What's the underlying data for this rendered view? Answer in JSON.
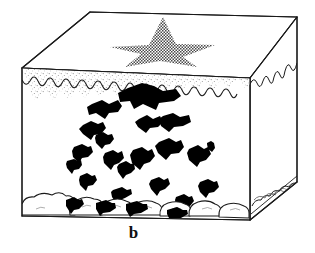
{
  "figure": {
    "caption_label": "b",
    "title_alt": "Block diagram of sediment profile",
    "colors": {
      "line": "#1a1a1a",
      "clast_fill": "#000000",
      "halftone": "#555555",
      "stipple": "#7a7a7a",
      "background": "#ffffff"
    }
  },
  "geometry": {
    "front_face": {
      "top_left": [
        22,
        68
      ],
      "top_right": [
        250,
        78
      ],
      "bottom_right": [
        250,
        220
      ],
      "bottom_left": [
        22,
        216
      ]
    },
    "top_face": {
      "front_left": [
        22,
        68
      ],
      "back_left": [
        90,
        12
      ],
      "back_right": [
        297,
        17
      ],
      "front_right": [
        250,
        78
      ]
    },
    "right_face": {
      "front_top": [
        250,
        78
      ],
      "back_top": [
        297,
        17
      ],
      "back_bottom": [
        297,
        182
      ],
      "front_bottom": [
        250,
        220
      ]
    }
  },
  "elements": {
    "top_surface_star": {
      "name": "halftone-star",
      "points": "163,18 175,45 214,46 182,58 196,66 160,62 126,66 141,54 110,48 148,45",
      "fill_pattern": "checkerboard-halftone"
    },
    "surface_layer": {
      "name": "stippled-surface-layer",
      "description": "thin stippled band below top edge of front face",
      "wavy_baseline": "M22,82 q4,9 9,2 q4,-8 8,1 q4,9 8,1 q4,-9 8,0 q4,10 8,2 q5,-10 9,0 q4,9 8,1 q4,-9 8,0 q4,10 8,1 q4,-9 8,-1 q4,10 8,1 q4,-9 8,-1 q4,10 8,0 q4,-9 8,-1 q4,10 8,0 q4,-9 8,-1 q4,10 8,0 q4,-9 8,-1 q4,10 8,0 q4,-9 8,-1 q4,10 8,0 q4,-9 8,-1 q5,10 9,0 q4,-9 8,-1 q4,10 8,-1 q4,-9 8,-1"
    },
    "right_face_wavy_edge": {
      "name": "right-face-surface-wave",
      "description": "scalloped surface boundary descending along the right face"
    },
    "basal_layer": {
      "name": "cobble-gravel-layer",
      "description": "rounded cobble / boulder clasts forming the base of the front face",
      "cobble_count": 9
    },
    "right_face_cobbles": {
      "name": "right-face-cobble-layer",
      "cobble_count": 5
    },
    "suspended_clasts": {
      "name": "angular-black-clasts",
      "description": "irregular angular black fragments suspended in the matrix",
      "count": 19,
      "shapes": [
        "M128,88 l14,-4 l12,2 l8,5 l12,-2 l5,6 l-6,5 l-14,2 l-3,6 l-12,-5 l-8,4 l-4,-7 l-9,1 l-2,-8 z",
        "M92,104 l10,-3 l6,3 l9,-4 l4,6 l-4,5 l-9,1 l-4,6 l-8,-5 l-7,2 l-2,-7 z",
        "M139,119 l8,-3 l5,4 l7,-3 l3,5 l-5,5 l-8,0 l-4,4 l-7,-5 l-3,-4 z",
        "M163,117 l9,-2 l7,3 l8,-1 l2,6 l-7,4 l-9,0 l-5,5 l-7,-6 l-2,-6 z",
        "M83,126 l8,-4 l7,3 l4,-2 l3,6 l-4,5 l-7,1 l-3,5 l-7,-6 l-4,-4 z",
        "M159,143 l9,-3 l7,3 l5,-2 l3,7 l-5,5 l-8,1 l-4,5 l-8,-6 l-3,-6 z",
        "M134,150 l8,-2 l6,3 l4,-2 l3,6 l-4,6 l-6,2 l-4,6 l-8,-7 l-2,-7 z",
        "M96,136 l6,-3 l5,3 l4,-1 l1,5 l-4,4 l-5,0 l-3,4 l-5,-5 l-1,-5 z",
        "M75,147 l7,-2 l6,2 l3,-1 l2,5 l-4,5 l-6,1 l-3,4 l-6,-6 l-1,-5 z",
        "M106,153 l7,-2 l5,3 l4,-2 l2,6 l-4,5 l-5,1 l-3,5 l-7,-6 l-1,-6 z",
        "M189,150 l8,-3 l6,3 l4,-2 l3,6 l-4,6 l-6,1 l-3,5 l-8,-6 l-2,-6 z",
        "M80,177 l6,-2 l5,2 l3,-1 l2,5 l-4,4 l-5,1 l-2,4 l-6,-5 l-1,-5 z",
        "M151,180 l7,-2 l5,3 l4,-2 l2,5 l-4,5 l-5,1 l-3,5 l-6,-6 l-2,-5 z",
        "M200,182 l7,-2 l6,2 l3,-1 l2,5 l-4,5 l-5,1 l-3,5 l-6,-6 l-2,-5 z",
        "M113,191 l8,-3 l5,3 l4,-1 l1,4 l-6,4 l-5,1 l-4,3 l-4,-5 l-1,-4 z",
        "M207,144 l4,-2 l3,2 l1,4 l-3,4 l-4,-3 l-1,-4 z",
        "M176,197 l7,-2 l5,2 l3,-1 l2,5 l-4,4 l-5,1 l-3,4 l-6,-5 l-1,-5 z",
        "M68,161 l6,-2 l4,2 l3,-1 l1,4 l-3,4 l-5,1 l-2,4 l-5,-5 l-1,-4 z",
        "M119,165 l6,-2 l5,2 l3,-1 l1,5 l-4,4 l-4,1 l-3,4 l-5,-6 l-1,-4 z"
      ]
    }
  }
}
